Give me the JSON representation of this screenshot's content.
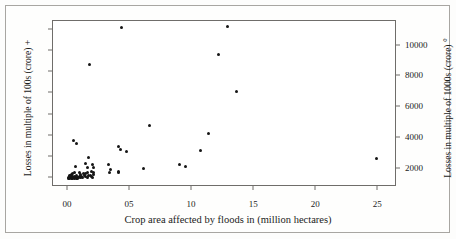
{
  "chart_data": {
    "type": "scatter",
    "title": "",
    "xlabel": "Crop area affected by floods in (million hectares)",
    "ylabel": "Losses in multiple of 100s (crore) +",
    "y2label": "Losses in multiple of 1000s (crore) °",
    "xlim": [
      -1.2,
      26.5
    ],
    "ylim": [
      -40,
      740
    ],
    "y2lim": [
      800,
      11600
    ],
    "grid": false,
    "legend": null,
    "xticks": [
      0,
      5,
      10,
      15,
      20,
      25
    ],
    "xtick_labels": [
      "00",
      "05",
      "10",
      "15",
      "20",
      "25"
    ],
    "yticks": [
      0,
      100,
      200,
      300,
      400,
      500,
      600,
      700
    ],
    "ytick_labels": [
      "0",
      "100",
      "200",
      "300",
      "400",
      "500",
      "600",
      "700"
    ],
    "y2ticks": [
      2000,
      4000,
      6000,
      8000,
      10000
    ],
    "y2tick_labels": [
      "2000",
      "4000",
      "6000",
      "8000",
      "10000"
    ],
    "marker": "dot",
    "marker_color": "#151515",
    "points": [
      {
        "x": 4.35,
        "y": 710
      },
      {
        "x": 12.85,
        "y": 712
      },
      {
        "x": 12.15,
        "y": 582
      },
      {
        "x": 1.72,
        "y": 537
      },
      {
        "x": 13.6,
        "y": 410
      },
      {
        "x": 6.55,
        "y": 250
      },
      {
        "x": 11.35,
        "y": 213
      },
      {
        "x": 0.45,
        "y": 180
      },
      {
        "x": 0.72,
        "y": 165
      },
      {
        "x": 4.1,
        "y": 148
      },
      {
        "x": 4.2,
        "y": 138
      },
      {
        "x": 4.75,
        "y": 125
      },
      {
        "x": 10.7,
        "y": 130
      },
      {
        "x": 24.85,
        "y": 95
      },
      {
        "x": 1.68,
        "y": 100
      },
      {
        "x": 1.42,
        "y": 72
      },
      {
        "x": 1.95,
        "y": 68
      },
      {
        "x": 3.25,
        "y": 65
      },
      {
        "x": 8.95,
        "y": 65
      },
      {
        "x": 9.5,
        "y": 57
      },
      {
        "x": 0.62,
        "y": 55
      },
      {
        "x": 1.58,
        "y": 52
      },
      {
        "x": 2.05,
        "y": 52
      },
      {
        "x": 6.05,
        "y": 47
      },
      {
        "x": 3.45,
        "y": 40
      },
      {
        "x": 4.05,
        "y": 33
      },
      {
        "x": 4.1,
        "y": 26
      },
      {
        "x": 1.9,
        "y": 32
      },
      {
        "x": 2.05,
        "y": 28
      },
      {
        "x": 1.6,
        "y": 30
      },
      {
        "x": 3.35,
        "y": 28
      },
      {
        "x": 1.25,
        "y": 25
      },
      {
        "x": 1.4,
        "y": 22
      },
      {
        "x": 1.05,
        "y": 20
      },
      {
        "x": 0.92,
        "y": 28
      },
      {
        "x": 0.55,
        "y": 30
      },
      {
        "x": 0.4,
        "y": 22
      },
      {
        "x": 0.3,
        "y": 18
      },
      {
        "x": 0.22,
        "y": 14
      },
      {
        "x": 0.15,
        "y": 12
      },
      {
        "x": 0.1,
        "y": 9
      },
      {
        "x": 0.05,
        "y": 7
      },
      {
        "x": 0.12,
        "y": 5
      },
      {
        "x": 0.2,
        "y": 4
      },
      {
        "x": 0.28,
        "y": 8
      },
      {
        "x": 0.35,
        "y": 11
      },
      {
        "x": 0.42,
        "y": 6
      },
      {
        "x": 0.5,
        "y": 9
      },
      {
        "x": 0.58,
        "y": 5
      },
      {
        "x": 0.66,
        "y": 12
      },
      {
        "x": 0.74,
        "y": 7
      },
      {
        "x": 0.82,
        "y": 4
      },
      {
        "x": 0.9,
        "y": 10
      },
      {
        "x": 0.98,
        "y": 6
      },
      {
        "x": 1.1,
        "y": 8
      },
      {
        "x": 1.2,
        "y": 5
      },
      {
        "x": 1.3,
        "y": 12
      },
      {
        "x": 1.45,
        "y": 9
      },
      {
        "x": 1.55,
        "y": 6
      },
      {
        "x": 1.65,
        "y": 13
      },
      {
        "x": 1.78,
        "y": 16
      },
      {
        "x": 1.88,
        "y": 10
      },
      {
        "x": 1.98,
        "y": 3
      },
      {
        "x": 2.1,
        "y": 18
      },
      {
        "x": 0.06,
        "y": 2
      },
      {
        "x": 0.16,
        "y": 1
      },
      {
        "x": 0.26,
        "y": 2
      },
      {
        "x": 0.36,
        "y": 1
      },
      {
        "x": 0.46,
        "y": 3
      },
      {
        "x": 0.56,
        "y": 1
      },
      {
        "x": 0.66,
        "y": 2
      },
      {
        "x": 0.76,
        "y": 1
      }
    ]
  }
}
